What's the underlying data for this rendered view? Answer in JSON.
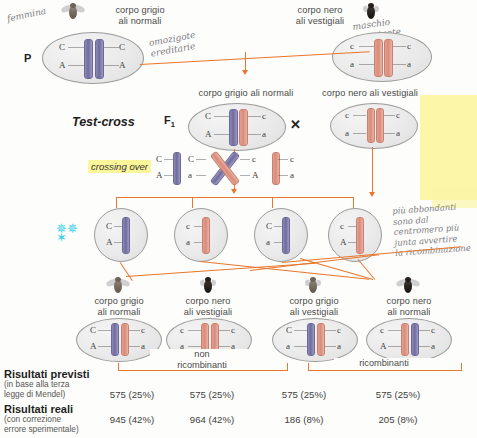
{
  "figure": {
    "topic": "Test-cross Drosophila: associazione e crossing over",
    "generations": {
      "p_label": "P",
      "f1_label": "F",
      "f1_sub": "1",
      "testcross_label": "Test-cross",
      "cross_symbol": "✕"
    },
    "crossing_over_label": "crossing over"
  },
  "parents": [
    {
      "id": "p-female",
      "phenotype_line1": "corpo grigio",
      "phenotype_line2": "ali normali",
      "fly": "gray-normal",
      "genotype": {
        "top_left": "C",
        "top_right": "C",
        "bottom_left": "A",
        "bottom_right": "A"
      },
      "chromosome_colors": [
        "purple",
        "purple"
      ]
    },
    {
      "id": "p-male",
      "phenotype_line1": "corpo nero",
      "phenotype_line2": "ali vestigiali",
      "fly": "black-vestigial",
      "genotype": {
        "top_left": "c",
        "top_right": "c",
        "bottom_left": "a",
        "bottom_right": "a"
      },
      "chromosome_colors": [
        "salmon",
        "salmon"
      ]
    }
  ],
  "f1": {
    "label_text": "corpo grigio ali normali",
    "genotype": {
      "top_left": "C",
      "top_right": "c",
      "bottom_left": "A",
      "bottom_right": "a"
    },
    "chromosome_colors": [
      "purple",
      "salmon"
    ]
  },
  "testcross_parent": {
    "label_text": "corpo nero ali vestigiali",
    "genotype": {
      "top_left": "c",
      "top_right": "c",
      "bottom_left": "a",
      "bottom_right": "a"
    },
    "chromosome_colors": [
      "salmon",
      "salmon"
    ]
  },
  "crossing_over": {
    "chromatids": [
      {
        "top": "C",
        "bottom": "A",
        "color": "purple",
        "crossed": false
      },
      {
        "top": "C",
        "bottom": "a",
        "color": "purple",
        "crossed": true
      },
      {
        "top": "c",
        "bottom": "A",
        "color": "salmon",
        "crossed": true
      },
      {
        "top": "c",
        "bottom": "a",
        "color": "salmon",
        "crossed": false
      }
    ]
  },
  "gametes": [
    {
      "top": "C",
      "bottom": "A",
      "color": "purple"
    },
    {
      "top": "c",
      "bottom": "a",
      "color": "salmon"
    },
    {
      "top": "C",
      "bottom": "a",
      "color": "purple"
    },
    {
      "top": "c",
      "bottom": "A",
      "color": "salmon"
    }
  ],
  "testcross_gamete": {
    "top": "c",
    "bottom": "a",
    "color": "salmon"
  },
  "offspring": [
    {
      "fly": "gray-normal",
      "phenotype_line1": "corpo grigio",
      "phenotype_line2": "ali normali",
      "genotype": {
        "top_left": "C",
        "top_right": "c",
        "bottom_left": "A",
        "bottom_right": "a"
      },
      "chromosome_colors": [
        "purple",
        "salmon"
      ],
      "class": "non ricombinante"
    },
    {
      "fly": "black-vestigial",
      "phenotype_line1": "corpo nero",
      "phenotype_line2": "ali vestigiali",
      "genotype": {
        "top_left": "c",
        "top_right": "c",
        "bottom_left": "a",
        "bottom_right": "a"
      },
      "chromosome_colors": [
        "salmon",
        "salmon"
      ],
      "class": "non ricombinante"
    },
    {
      "fly": "gray-vestigial",
      "phenotype_line1": "corpo grigio",
      "phenotype_line2": "ali vestigiali",
      "genotype": {
        "top_left": "C",
        "top_right": "c",
        "bottom_left": "a",
        "bottom_right": "a"
      },
      "chromosome_colors": [
        "purple",
        "salmon"
      ],
      "class": "ricombinante"
    },
    {
      "fly": "black-normal",
      "phenotype_line1": "corpo nero",
      "phenotype_line2": "ali normali",
      "genotype": {
        "top_left": "c",
        "top_right": "c",
        "bottom_left": "A",
        "bottom_right": "a"
      },
      "chromosome_colors": [
        "salmon",
        "purple"
      ],
      "class": "ricombinante"
    }
  ],
  "brackets": {
    "left_line1": "non",
    "left_line2": "ricombinanti",
    "right": "ricombinanti"
  },
  "results": {
    "rows": [
      {
        "title": "Risultati previsti",
        "sub_line1": "(in base alla terza",
        "sub_line2": "legge di Mendel)",
        "values": [
          "575 (25%)",
          "575 (25%)",
          "575 (25%)",
          "575 (25%)"
        ]
      },
      {
        "title": "Risultati reali",
        "sub_line1": "(con correzione",
        "sub_line2": "errore sperimentale)",
        "values": [
          "945 (42%)",
          "964 (42%)",
          "186 (8%)",
          "205 (8%)"
        ]
      }
    ]
  },
  "annotations": [
    {
      "id": "hw-femmina",
      "text": "femmina",
      "x": 6,
      "y": 14,
      "rotate": -12
    },
    {
      "id": "hw-omozigote",
      "text": "omozigote\nereditarie",
      "x": 150,
      "y": 40,
      "rotate": -10
    },
    {
      "id": "hw-maschio",
      "text": "maschio\nomozigote\nrecessivo",
      "x": 352,
      "y": 24,
      "rotate": -8
    },
    {
      "id": "hw-right-note",
      "text": "più abbondanti\nsono dal\ncentromero più\njunta avvertire\nla ricombinazione",
      "x": 392,
      "y": 206,
      "rotate": -4
    }
  ]
}
